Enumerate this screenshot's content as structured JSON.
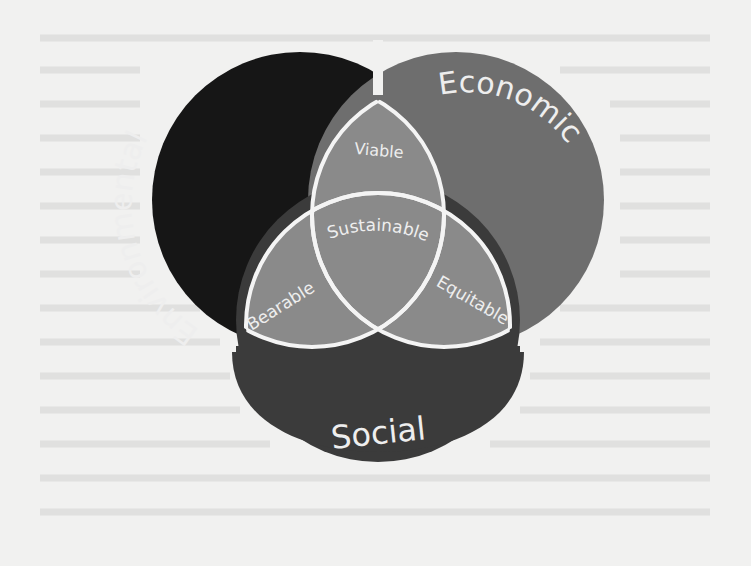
{
  "diagram": {
    "circles": {
      "environmental": {
        "label": "Environmental",
        "color": "#161616"
      },
      "economic": {
        "label": "Economic",
        "color": "#6e6e6e"
      },
      "social": {
        "label": "Social",
        "color": "#3b3b3b"
      }
    },
    "intersections": {
      "viable": {
        "label": "Viable",
        "between": [
          "Environmental",
          "Economic"
        ]
      },
      "bearable": {
        "label": "Bearable",
        "between": [
          "Environmental",
          "Social"
        ]
      },
      "equitable": {
        "label": "Equitable",
        "between": [
          "Economic",
          "Social"
        ]
      },
      "sustainable": {
        "label": "Sustainable",
        "between": [
          "Environmental",
          "Economic",
          "Social"
        ]
      }
    },
    "inner_fill": "#8a8a8a",
    "stroke": "#f4f4f4",
    "background": "#f1f1f0"
  }
}
